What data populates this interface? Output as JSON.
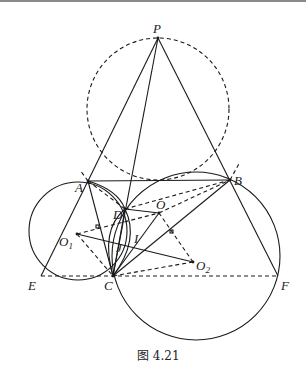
{
  "figure": {
    "caption": "图 4.21",
    "labels": {
      "P": "P",
      "A": "A",
      "B": "B",
      "D": "D",
      "O": "O",
      "O1": "O",
      "O1_sub": "1",
      "O2": "O",
      "O2_sub": "2",
      "I": "I",
      "J": "J",
      "E": "E",
      "C": "C",
      "F": "F"
    }
  },
  "colors": {
    "ink": "#1a1a1a",
    "background": "#ffffff"
  }
}
